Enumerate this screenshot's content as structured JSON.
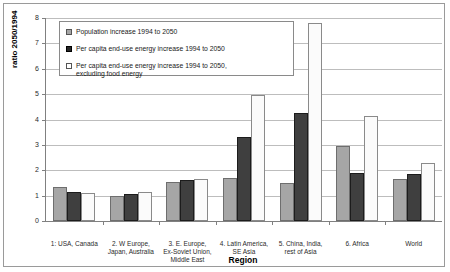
{
  "chart_data": {
    "type": "bar",
    "title": "",
    "xlabel": "Region",
    "ylabel": "ratio 2050/1994",
    "ylim": [
      0,
      8
    ],
    "yticks": [
      0,
      1,
      2,
      3,
      4,
      5,
      6,
      7,
      8
    ],
    "grid": true,
    "legend_position": "top-left-inside",
    "categories": [
      "1: USA, Canada",
      "2. W Europe,\nJapan, Australia",
      "3. E. Europe,\nEx-Soviet Union,\nMiddle East",
      "4. Latin America,\nSE Asia",
      "5. China, India,\nrest of Asia",
      "6. Africa",
      "World"
    ],
    "series": [
      {
        "name": "Population increase 1994 to 2050",
        "color": "#a6a6a6",
        "values": [
          1.35,
          1.0,
          1.55,
          1.7,
          1.5,
          2.95,
          1.65
        ]
      },
      {
        "name": "Per capita end-use energy increase 1994 to 2050",
        "color": "#3f3f3f",
        "values": [
          1.15,
          1.05,
          1.6,
          3.3,
          4.25,
          1.9,
          1.85
        ]
      },
      {
        "name": "Per capita end-use energy increase 1994 to 2050,\nexcluding food energy",
        "color": "#fbfbfb",
        "values": [
          1.1,
          1.15,
          1.65,
          4.95,
          7.8,
          4.15,
          2.3
        ]
      }
    ]
  }
}
